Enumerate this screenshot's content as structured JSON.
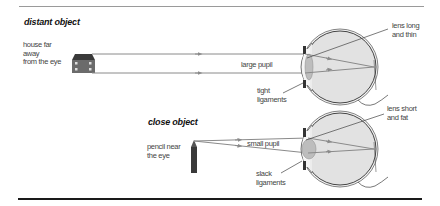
{
  "diagram": {
    "panels": [
      {
        "heading": "distant object",
        "object_label": [
          "house far",
          "away",
          "from the eye"
        ],
        "object_icon": "house-icon",
        "pupil_label": "large pupil",
        "ligament_label": [
          "tight",
          "ligaments"
        ],
        "lens_label": [
          "lens long",
          "and thin"
        ]
      },
      {
        "heading": "close object",
        "object_label": [
          "pencil near",
          "the eye"
        ],
        "object_icon": "pencil-icon",
        "pupil_label": "small pupil",
        "ligament_label": [
          "slack",
          "ligaments"
        ],
        "lens_label": [
          "lens short",
          "and fat"
        ]
      }
    ],
    "colors": {
      "ray": "#8a8a8a",
      "eye_fill": "#e4e4e4",
      "eye_outline": "#555555",
      "lens": "#bdbdbd",
      "object": "#4a4a4a",
      "top_rule": "#9a9a9a",
      "bottom_rule": "#1a1a1a"
    }
  }
}
